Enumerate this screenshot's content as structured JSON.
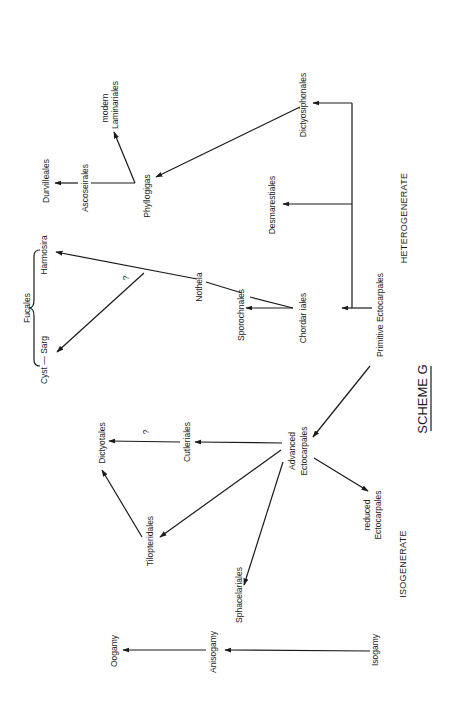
{
  "diagram": {
    "title": "SCHEME G",
    "orientation": "rotated 90° counter-clockwise (text reads bottom-to-top)",
    "regions": {
      "heterogenerate": "HETEROGENERATE",
      "isogenerate": "ISOGENERATE"
    },
    "nodes": {
      "primitive_ectocarpales": "Primitive Ectocarpales",
      "chordariales": "Chordar iales",
      "sporochnales": "Sporochnales",
      "notheia": "Notheia",
      "harmosira": "Harmosira",
      "cyst_sarg": "Cyst — Sarg",
      "fucales": "Fucales",
      "desmarestiales": "Desmarestiales",
      "dictyosiphonales": "Dictyosiphonales",
      "phyllogigas": "Phyllogigas",
      "ascoseirales": "Ascoseirales",
      "durvilleales": "Durvilleales",
      "modern": "modern",
      "laminariales": "Laminariales",
      "advanced": "Advanced",
      "advanced_ectocarpales": "Ectocarpales",
      "cutleriales": "Cutleriales",
      "dictyotales": "Dictyotales",
      "tilopteridales": "Tilopteridales",
      "sphacelariales": "Sphacelariales",
      "reduced": "reduced",
      "reduced_ectocarpales": "Ectocarpales",
      "isogamy": "Isogamy",
      "anisogamy": "Anisogamy",
      "oogamy": "Oogamy"
    },
    "question_marks": {
      "fucales_branch": "?",
      "dictyotales_branch": "?"
    },
    "edges": [
      {
        "from": "Primitive Ectocarpales",
        "to": "Chordariales"
      },
      {
        "from": "Primitive Ectocarpales",
        "to": "Desmarestiales"
      },
      {
        "from": "Primitive Ectocarpales",
        "to": "Dictyosiphonales"
      },
      {
        "from": "Primitive Ectocarpales",
        "to": "Advanced Ectocarpales"
      },
      {
        "from": "Chordariales",
        "to": "Sporochnales"
      },
      {
        "from": "Chordariales",
        "to": "Harmosira",
        "via": "Notheia"
      },
      {
        "from": "Notheia branch",
        "to": "Cyst — Sarg",
        "uncertain": true
      },
      {
        "from": "Dictyosiphonales",
        "to": "Phyllogigas"
      },
      {
        "from": "Phyllogigas",
        "to": "Ascoseirales"
      },
      {
        "from": "Ascoseirales",
        "to": "Durvilleales"
      },
      {
        "from": "Phyllogigas",
        "to": "modern Laminariales"
      },
      {
        "from": "Advanced Ectocarpales",
        "to": "Cutleriales"
      },
      {
        "from": "Cutleriales",
        "to": "Dictyotales",
        "uncertain": true
      },
      {
        "from": "Advanced Ectocarpales",
        "to": "Tilopteridales"
      },
      {
        "from": "Tilopteridales",
        "to": "Dictyotales"
      },
      {
        "from": "Advanced Ectocarpales",
        "to": "Sphacelariales"
      },
      {
        "from": "Advanced Ectocarpales",
        "to": "reduced Ectocarpales"
      },
      {
        "from": "Isogamy",
        "to": "Anisogamy"
      },
      {
        "from": "Anisogamy",
        "to": "Oogamy"
      }
    ]
  }
}
